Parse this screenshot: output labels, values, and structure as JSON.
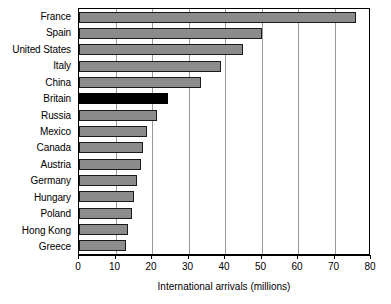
{
  "chart_data": {
    "type": "bar",
    "orientation": "horizontal",
    "title": "",
    "xlabel": "International arrivals (millions)",
    "ylabel": "",
    "xlim": [
      0,
      80
    ],
    "xticks": [
      0,
      10,
      20,
      30,
      40,
      50,
      60,
      70,
      80
    ],
    "grid": "vertical",
    "legend": "none",
    "categories": [
      "France",
      "Spain",
      "United States",
      "Italy",
      "China",
      "Britain",
      "Russia",
      "Mexico",
      "Canada",
      "Austria",
      "Germany",
      "Hungary",
      "Poland",
      "Hong Kong",
      "Greece"
    ],
    "values": [
      76,
      50,
      45,
      39,
      33.5,
      24.5,
      21.5,
      18.5,
      17.5,
      17,
      16,
      15,
      14.5,
      13.5,
      13
    ],
    "highlight_category": "Britain",
    "colors": {
      "bar_fill": "#8c8c8c",
      "bar_border": "#1a1a1a",
      "highlight_fill": "#000000",
      "gridline": "#9a9a9a",
      "axis": "#000000",
      "background": "#ffffff",
      "text": "#000000"
    }
  }
}
